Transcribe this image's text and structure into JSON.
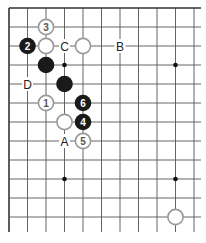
{
  "diagram": {
    "type": "go-board-fragment",
    "grid": {
      "origin_x": 9,
      "origin_y": 8,
      "spacing_x": 18.5,
      "spacing_y": 19,
      "cols": 11,
      "rows": 12,
      "extends_right": true,
      "extends_bottom": true,
      "line_color": "#555555",
      "border_color": "#333333"
    },
    "star_points": [
      {
        "col": 3,
        "row": 3
      },
      {
        "col": 9,
        "row": 3
      },
      {
        "col": 3,
        "row": 9
      },
      {
        "col": 9,
        "row": 9
      }
    ],
    "stones": [
      {
        "color": "white",
        "col": 2,
        "row": 1,
        "label": "3"
      },
      {
        "color": "black",
        "col": 1,
        "row": 2,
        "label": "2"
      },
      {
        "color": "white",
        "col": 2,
        "row": 2,
        "label": ""
      },
      {
        "color": "white",
        "col": 4,
        "row": 2,
        "label": ""
      },
      {
        "color": "black",
        "col": 2,
        "row": 3,
        "label": ""
      },
      {
        "color": "black",
        "col": 3,
        "row": 4,
        "label": ""
      },
      {
        "color": "white",
        "col": 2,
        "row": 5,
        "label": "1"
      },
      {
        "color": "black",
        "col": 4,
        "row": 5,
        "label": "6"
      },
      {
        "color": "white",
        "col": 3,
        "row": 6,
        "label": ""
      },
      {
        "color": "black",
        "col": 4,
        "row": 6,
        "label": "4"
      },
      {
        "color": "white",
        "col": 4,
        "row": 7,
        "label": "5"
      },
      {
        "color": "white",
        "col": 9,
        "row": 11,
        "label": ""
      }
    ],
    "letter_marks": [
      {
        "text": "C",
        "col": 3,
        "row": 2
      },
      {
        "text": "B",
        "col": 6,
        "row": 2
      },
      {
        "text": "D",
        "col": 1,
        "row": 4
      },
      {
        "text": "A",
        "col": 3,
        "row": 7
      }
    ],
    "colors": {
      "black_stone": "#1a1a1a",
      "white_stone_fill": "#ffffff",
      "white_stone_stroke": "#999999",
      "white_label": "#555555",
      "black_label": "#ffffff",
      "letter": "#222222"
    }
  }
}
